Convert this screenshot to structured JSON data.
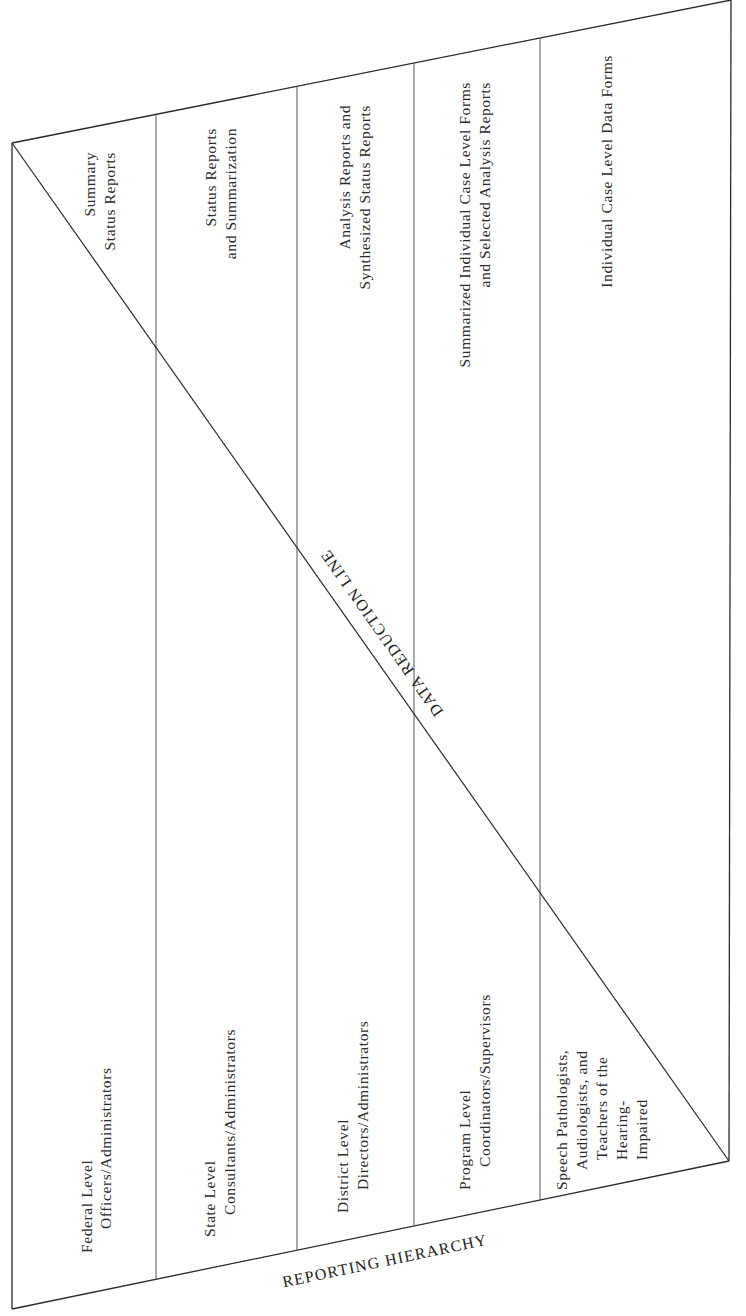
{
  "diagram": {
    "title_bottom": "REPORTING HIERARCHY",
    "diagonal_label": "DATA REDUCTION LINE",
    "columns": [
      {
        "level": [
          "Federal Level",
          "Officers/Administrators"
        ],
        "reports": [
          "Summary",
          "Status Reports"
        ]
      },
      {
        "level": [
          "State Level",
          "Consultants/Administrators"
        ],
        "reports": [
          "Status Reports",
          "and Summarization"
        ]
      },
      {
        "level": [
          "District Level",
          "Directors/Administrators"
        ],
        "reports": [
          "Analysis Reports and",
          "Synthesized Status Reports"
        ]
      },
      {
        "level": [
          "Program Level",
          "Coordinators/Supervisors"
        ],
        "reports": [
          "Summarized Individual Case Level Forms",
          "and Selected Analysis Reports"
        ]
      },
      {
        "level": [
          "Speech Pathologists,",
          "Audiologists, and",
          "Teachers of the",
          "Hearing-",
          "Impaired"
        ],
        "reports": [
          "Individual Case Level Data Forms"
        ]
      }
    ]
  }
}
